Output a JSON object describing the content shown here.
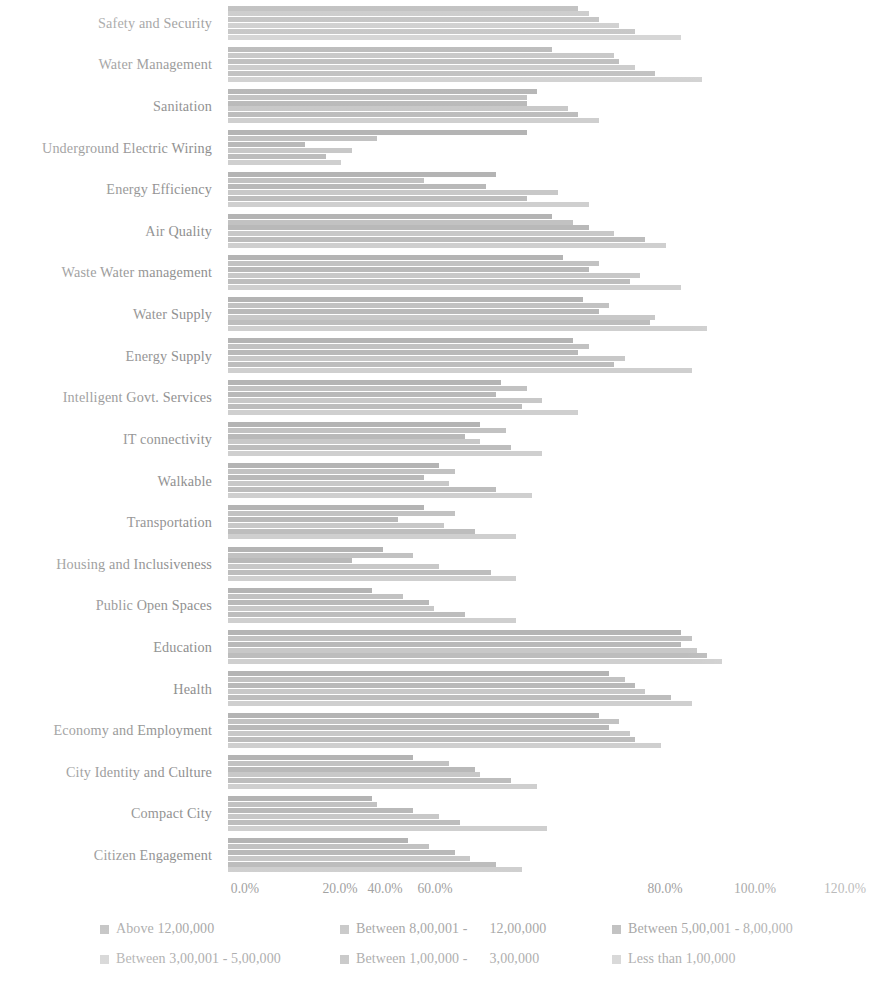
{
  "chart_data": {
    "type": "bar",
    "orientation": "horizontal",
    "grouped": true,
    "title": "",
    "subtitle": "",
    "xlabel": "",
    "ylabel": "",
    "xlim": [
      0,
      120
    ],
    "xtick_labels": [
      "0.0%",
      "20.0%",
      "40.0%",
      "60.0%",
      "80.0%",
      "100.0%",
      "120.0%"
    ],
    "xtick_values": [
      0,
      20,
      40,
      60,
      80,
      100,
      120
    ],
    "xtick_pixel_centers": [
      245,
      340,
      385,
      435,
      665,
      755,
      845
    ],
    "grid": false,
    "legend_position": "bottom",
    "categories": [
      "Safety and Security",
      "Water Management",
      "Sanitation",
      "Underground Electric Wiring",
      "Energy Efficiency",
      "Air Quality",
      "Waste Water management",
      "Water Supply",
      "Energy Supply",
      "Intelligent Govt. Services",
      "IT connectivity",
      "Walkable",
      "Transportation",
      "Housing and Inclusiveness",
      "Public Open Spaces",
      "Education",
      "Health",
      "Economy and Employment",
      "City Identity and Culture",
      "Compact City",
      "Citizen Engagement"
    ],
    "series": [
      {
        "name": "Above 12,00,000",
        "color": "#b4b4b4",
        "values": [
          68,
          63,
          60,
          58,
          52,
          63,
          65,
          69,
          67,
          53,
          49,
          41,
          38,
          30,
          28,
          88,
          74,
          72,
          36,
          28,
          35
        ]
      },
      {
        "name": "Between 8,00,001 -  12,00,000",
        "color": "#c2c2c2",
        "values": [
          70,
          75,
          58,
          29,
          38,
          67,
          72,
          74,
          70,
          58,
          54,
          44,
          44,
          36,
          34,
          90,
          77,
          76,
          43,
          29,
          39
        ]
      },
      {
        "name": "Between 5,00,001 - 8,00,000",
        "color": "#b9b9b9",
        "values": [
          72,
          76,
          58,
          15,
          50,
          70,
          70,
          72,
          68,
          52,
          46,
          38,
          33,
          24,
          39,
          88,
          79,
          74,
          48,
          36,
          44
        ]
      },
      {
        "name": "Between 3,00,001 - 5,00,000",
        "color": "#c8c8c8",
        "values": [
          76,
          79,
          66,
          24,
          64,
          75,
          80,
          83,
          77,
          61,
          49,
          43,
          42,
          41,
          40,
          91,
          81,
          78,
          49,
          41,
          47
        ]
      },
      {
        "name": "Between 1,00,000 -  3,00,000",
        "color": "#bdbdbd",
        "values": [
          79,
          83,
          68,
          19,
          58,
          81,
          78,
          82,
          75,
          57,
          55,
          52,
          48,
          51,
          46,
          93,
          86,
          79,
          55,
          45,
          52
        ]
      },
      {
        "name": "Less than 1,00,000",
        "color": "#cfcfcf",
        "values": [
          88,
          92,
          72,
          22,
          70,
          85,
          88,
          93,
          90,
          68,
          61,
          59,
          56,
          56,
          56,
          96,
          90,
          84,
          60,
          62,
          57
        ]
      }
    ]
  },
  "axis": {
    "category_label_align": "right"
  },
  "legend": {
    "items": [
      {
        "label": "Above 12,00,000",
        "color": "#b4b4b4"
      },
      {
        "label": "Between 8,00,001 -",
        "label_tail": "12,00,000",
        "color": "#c2c2c2"
      },
      {
        "label": "Between 5,00,001 - 8,00,000",
        "color": "#b9b9b9"
      },
      {
        "label": "Between 3,00,001 - 5,00,000",
        "color": "#c8c8c8"
      },
      {
        "label": "Between 1,00,000 -",
        "label_tail": "3,00,000",
        "color": "#bdbdbd"
      },
      {
        "label": "Less than 1,00,000",
        "color": "#cfcfcf"
      }
    ]
  }
}
